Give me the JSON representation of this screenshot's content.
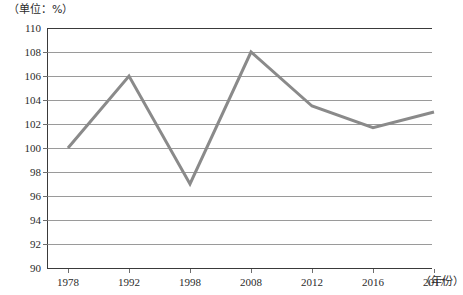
{
  "chart_data": {
    "type": "line",
    "title": "",
    "subtitle": "",
    "unit_label": "（单位：%）",
    "xlabel": "（年份）",
    "ylabel": "",
    "categories": [
      "1978",
      "1992",
      "1998",
      "2008",
      "2012",
      "2016",
      "2017"
    ],
    "values": [
      100,
      106,
      97,
      108,
      103.5,
      101.7,
      103
    ],
    "series": [
      {
        "name": "",
        "values": [
          100,
          106,
          97,
          108,
          103.5,
          101.7,
          103
        ]
      }
    ],
    "ylim": [
      90,
      110
    ],
    "yticks": [
      110,
      108,
      106,
      104,
      102,
      100,
      98,
      96,
      94,
      92,
      90
    ],
    "ytick_labels": [
      "110",
      "108",
      "106",
      "104",
      "102",
      "100",
      "98",
      "96",
      "94",
      "92",
      "90"
    ],
    "grid": true,
    "grid_orientation": "horizontal",
    "legend": false,
    "legend_position": "none",
    "markers": false,
    "line_color": "#8a8a8a",
    "line_width": 3,
    "grid_color": "#9a9a9a",
    "axis_color": "#3a3a3a",
    "text_color": "#2b2b2b",
    "background": "#ffffff",
    "annotations": []
  }
}
